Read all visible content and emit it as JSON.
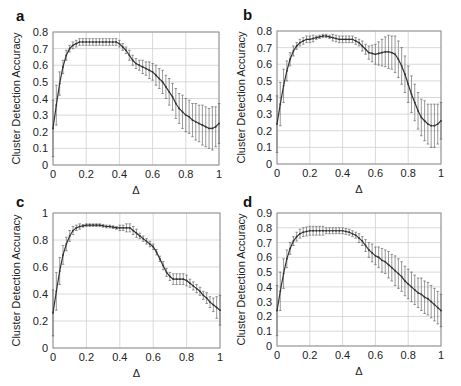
{
  "figure": {
    "ylabel": "Cluster Detection Accuracy",
    "xlabel": "Δ",
    "colors": {
      "line": "#333333",
      "errorbar": "#555555",
      "grid": "#cfcfcf",
      "frame": "#888888"
    }
  },
  "chart_data": [
    {
      "panel": "a",
      "type": "line",
      "title": "",
      "xlabel": "Δ",
      "ylabel": "Cluster Detection Accuracy",
      "xlim": [
        0,
        1
      ],
      "ylim": [
        0,
        0.8
      ],
      "xticks": [
        "0",
        "0.2",
        "0.4",
        "0.6",
        "0.8",
        "1"
      ],
      "yticks": [
        "0",
        "0.1",
        "0.2",
        "0.3",
        "0.4",
        "0.5",
        "0.6",
        "0.7",
        "0.8"
      ],
      "grid": true,
      "error_bars": true,
      "x": [
        0,
        0.02,
        0.04,
        0.06,
        0.08,
        0.1,
        0.12,
        0.14,
        0.16,
        0.18,
        0.2,
        0.22,
        0.24,
        0.26,
        0.28,
        0.3,
        0.32,
        0.34,
        0.36,
        0.38,
        0.4,
        0.42,
        0.44,
        0.46,
        0.48,
        0.5,
        0.52,
        0.54,
        0.56,
        0.58,
        0.6,
        0.62,
        0.64,
        0.66,
        0.68,
        0.7,
        0.72,
        0.74,
        0.76,
        0.78,
        0.8,
        0.82,
        0.84,
        0.86,
        0.88,
        0.9,
        0.92,
        0.94,
        0.96,
        0.98,
        1
      ],
      "values": [
        0.22,
        0.36,
        0.49,
        0.59,
        0.66,
        0.7,
        0.72,
        0.73,
        0.74,
        0.74,
        0.74,
        0.74,
        0.74,
        0.74,
        0.74,
        0.74,
        0.74,
        0.74,
        0.74,
        0.74,
        0.73,
        0.71,
        0.69,
        0.66,
        0.63,
        0.61,
        0.6,
        0.59,
        0.58,
        0.57,
        0.56,
        0.54,
        0.52,
        0.5,
        0.47,
        0.44,
        0.41,
        0.37,
        0.34,
        0.32,
        0.3,
        0.29,
        0.27,
        0.26,
        0.25,
        0.24,
        0.23,
        0.22,
        0.22,
        0.23,
        0.25
      ],
      "errors": [
        0.17,
        0.12,
        0.07,
        0.04,
        0.03,
        0.02,
        0.02,
        0.02,
        0.02,
        0.02,
        0.02,
        0.02,
        0.02,
        0.02,
        0.02,
        0.02,
        0.02,
        0.02,
        0.02,
        0.02,
        0.02,
        0.02,
        0.02,
        0.03,
        0.03,
        0.03,
        0.03,
        0.04,
        0.04,
        0.05,
        0.05,
        0.06,
        0.06,
        0.07,
        0.07,
        0.08,
        0.08,
        0.09,
        0.09,
        0.1,
        0.1,
        0.1,
        0.1,
        0.11,
        0.11,
        0.12,
        0.12,
        0.12,
        0.13,
        0.12,
        0.12
      ]
    },
    {
      "panel": "b",
      "type": "line",
      "title": "",
      "xlabel": "Δ",
      "ylabel": "Cluster Detection Accuracy",
      "xlim": [
        0,
        1
      ],
      "ylim": [
        0,
        0.8
      ],
      "xticks": [
        "0",
        "0.2",
        "0.4",
        "0.6",
        "0.8",
        "1"
      ],
      "yticks": [
        "0",
        "0.1",
        "0.2",
        "0.3",
        "0.4",
        "0.5",
        "0.6",
        "0.7",
        "0.8"
      ],
      "grid": true,
      "error_bars": true,
      "x": [
        0,
        0.02,
        0.04,
        0.06,
        0.08,
        0.1,
        0.12,
        0.14,
        0.16,
        0.18,
        0.2,
        0.22,
        0.24,
        0.26,
        0.28,
        0.3,
        0.32,
        0.34,
        0.36,
        0.38,
        0.4,
        0.42,
        0.44,
        0.46,
        0.48,
        0.5,
        0.52,
        0.54,
        0.56,
        0.58,
        0.6,
        0.62,
        0.64,
        0.66,
        0.68,
        0.7,
        0.72,
        0.74,
        0.76,
        0.78,
        0.8,
        0.82,
        0.84,
        0.86,
        0.88,
        0.9,
        0.92,
        0.94,
        0.96,
        0.98,
        1
      ],
      "values": [
        0.24,
        0.36,
        0.47,
        0.56,
        0.63,
        0.68,
        0.71,
        0.73,
        0.74,
        0.75,
        0.75,
        0.755,
        0.76,
        0.765,
        0.77,
        0.77,
        0.765,
        0.76,
        0.755,
        0.75,
        0.75,
        0.75,
        0.75,
        0.75,
        0.74,
        0.73,
        0.71,
        0.69,
        0.67,
        0.665,
        0.66,
        0.665,
        0.67,
        0.675,
        0.675,
        0.67,
        0.66,
        0.63,
        0.59,
        0.54,
        0.48,
        0.42,
        0.37,
        0.32,
        0.28,
        0.26,
        0.24,
        0.23,
        0.23,
        0.24,
        0.26
      ],
      "errors": [
        0.17,
        0.13,
        0.1,
        0.06,
        0.04,
        0.03,
        0.02,
        0.02,
        0.02,
        0.02,
        0.02,
        0.02,
        0.01,
        0.01,
        0.01,
        0.01,
        0.01,
        0.02,
        0.02,
        0.02,
        0.02,
        0.02,
        0.02,
        0.02,
        0.02,
        0.02,
        0.03,
        0.03,
        0.04,
        0.05,
        0.06,
        0.07,
        0.08,
        0.09,
        0.1,
        0.1,
        0.11,
        0.11,
        0.11,
        0.11,
        0.11,
        0.11,
        0.11,
        0.11,
        0.11,
        0.12,
        0.12,
        0.13,
        0.13,
        0.12,
        0.11
      ]
    },
    {
      "panel": "c",
      "type": "line",
      "title": "",
      "xlabel": "Δ",
      "ylabel": "Cluster Detection Accuracy",
      "xlim": [
        0,
        1
      ],
      "ylim": [
        0,
        1
      ],
      "xticks": [
        "0",
        "0.2",
        "0.4",
        "0.6",
        "0.8",
        "1"
      ],
      "yticks": [
        "0",
        "0.2",
        "0.4",
        "0.6",
        "0.8",
        "1"
      ],
      "grid": true,
      "error_bars": true,
      "x": [
        0,
        0.02,
        0.04,
        0.06,
        0.08,
        0.1,
        0.12,
        0.14,
        0.16,
        0.18,
        0.2,
        0.22,
        0.24,
        0.26,
        0.28,
        0.3,
        0.32,
        0.34,
        0.36,
        0.38,
        0.4,
        0.42,
        0.44,
        0.46,
        0.48,
        0.5,
        0.52,
        0.54,
        0.56,
        0.58,
        0.6,
        0.62,
        0.64,
        0.66,
        0.68,
        0.7,
        0.72,
        0.74,
        0.76,
        0.78,
        0.8,
        0.82,
        0.84,
        0.86,
        0.88,
        0.9,
        0.92,
        0.94,
        0.96,
        0.98,
        1
      ],
      "values": [
        0.26,
        0.42,
        0.57,
        0.69,
        0.77,
        0.83,
        0.87,
        0.89,
        0.9,
        0.905,
        0.91,
        0.91,
        0.91,
        0.91,
        0.91,
        0.905,
        0.9,
        0.9,
        0.895,
        0.89,
        0.89,
        0.89,
        0.89,
        0.89,
        0.87,
        0.85,
        0.83,
        0.81,
        0.79,
        0.77,
        0.75,
        0.71,
        0.66,
        0.61,
        0.56,
        0.53,
        0.51,
        0.51,
        0.51,
        0.51,
        0.5,
        0.48,
        0.46,
        0.44,
        0.42,
        0.39,
        0.37,
        0.34,
        0.32,
        0.3,
        0.28
      ],
      "errors": [
        0.17,
        0.14,
        0.1,
        0.07,
        0.05,
        0.04,
        0.03,
        0.02,
        0.02,
        0.01,
        0.01,
        0.01,
        0.01,
        0.01,
        0.01,
        0.01,
        0.01,
        0.01,
        0.01,
        0.01,
        0.02,
        0.02,
        0.03,
        0.03,
        0.03,
        0.03,
        0.02,
        0.02,
        0.02,
        0.02,
        0.02,
        0.02,
        0.02,
        0.03,
        0.03,
        0.03,
        0.04,
        0.04,
        0.04,
        0.04,
        0.04,
        0.03,
        0.03,
        0.03,
        0.03,
        0.03,
        0.04,
        0.04,
        0.05,
        0.08,
        0.11
      ]
    },
    {
      "panel": "d",
      "type": "line",
      "title": "",
      "xlabel": "Δ",
      "ylabel": "Cluster Detection Accuracy",
      "xlim": [
        0,
        1
      ],
      "ylim": [
        0,
        0.9
      ],
      "xticks": [
        "0",
        "0.2",
        "0.4",
        "0.6",
        "0.8",
        "1"
      ],
      "yticks": [
        "0",
        "0.1",
        "0.2",
        "0.3",
        "0.4",
        "0.5",
        "0.6",
        "0.7",
        "0.8",
        "0.9"
      ],
      "grid": true,
      "error_bars": true,
      "x": [
        0,
        0.02,
        0.04,
        0.06,
        0.08,
        0.1,
        0.12,
        0.14,
        0.16,
        0.18,
        0.2,
        0.22,
        0.24,
        0.26,
        0.28,
        0.3,
        0.32,
        0.34,
        0.36,
        0.38,
        0.4,
        0.42,
        0.44,
        0.46,
        0.48,
        0.5,
        0.52,
        0.54,
        0.56,
        0.58,
        0.6,
        0.62,
        0.64,
        0.66,
        0.68,
        0.7,
        0.72,
        0.74,
        0.76,
        0.78,
        0.8,
        0.82,
        0.84,
        0.86,
        0.88,
        0.9,
        0.92,
        0.94,
        0.96,
        0.98,
        1
      ],
      "values": [
        0.24,
        0.37,
        0.49,
        0.59,
        0.66,
        0.71,
        0.74,
        0.76,
        0.77,
        0.775,
        0.78,
        0.78,
        0.78,
        0.78,
        0.78,
        0.78,
        0.78,
        0.78,
        0.78,
        0.78,
        0.78,
        0.775,
        0.77,
        0.76,
        0.75,
        0.73,
        0.71,
        0.68,
        0.65,
        0.63,
        0.61,
        0.6,
        0.58,
        0.57,
        0.55,
        0.53,
        0.51,
        0.49,
        0.47,
        0.44,
        0.42,
        0.4,
        0.38,
        0.36,
        0.35,
        0.33,
        0.32,
        0.3,
        0.28,
        0.26,
        0.24
      ],
      "errors": [
        0.17,
        0.13,
        0.1,
        0.06,
        0.04,
        0.03,
        0.03,
        0.03,
        0.03,
        0.03,
        0.03,
        0.03,
        0.03,
        0.03,
        0.03,
        0.02,
        0.02,
        0.02,
        0.02,
        0.02,
        0.02,
        0.02,
        0.02,
        0.02,
        0.02,
        0.03,
        0.03,
        0.04,
        0.05,
        0.06,
        0.06,
        0.07,
        0.08,
        0.08,
        0.09,
        0.09,
        0.1,
        0.1,
        0.1,
        0.1,
        0.1,
        0.1,
        0.1,
        0.1,
        0.11,
        0.11,
        0.11,
        0.11,
        0.11,
        0.11,
        0.11
      ]
    }
  ],
  "panels": [
    {
      "letter": "a",
      "left": 53,
      "top": 32,
      "width": 166,
      "height": 133,
      "label_x": 16,
      "label_y": 10,
      "ylabel_x": 15
    },
    {
      "letter": "b",
      "left": 277,
      "top": 31,
      "width": 164,
      "height": 133,
      "label_x": 243,
      "label_y": 9,
      "ylabel_x": 240
    },
    {
      "letter": "c",
      "left": 53,
      "top": 213,
      "width": 167,
      "height": 135,
      "label_x": 16,
      "label_y": 196,
      "ylabel_x": 15
    },
    {
      "letter": "d",
      "left": 277,
      "top": 213,
      "width": 164,
      "height": 133,
      "label_x": 243,
      "label_y": 196,
      "ylabel_x": 240
    }
  ]
}
